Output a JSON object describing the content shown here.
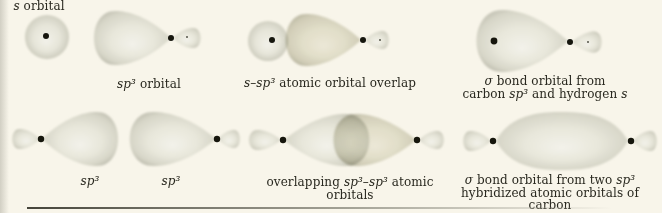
{
  "figure": {
    "name": "hybrid-orbital-bonding-diagrams",
    "panels": [
      {
        "id": "s-orbital",
        "caption": [
          {
            "t": "s",
            "i": true
          },
          {
            "t": " orbital"
          }
        ]
      },
      {
        "id": "sp3-orbital",
        "caption": [
          {
            "t": "sp³",
            "i": true
          },
          {
            "t": " orbital"
          }
        ]
      },
      {
        "id": "s-sp3-overlap",
        "caption": [
          {
            "t": "s",
            "i": true
          },
          {
            "t": "–"
          },
          {
            "t": "sp³",
            "i": true
          },
          {
            "t": " atomic orbital overlap"
          }
        ]
      },
      {
        "id": "sigma-bond-ch",
        "caption_lines": [
          [
            {
              "t": "σ",
              "i": true
            },
            {
              "t": " bond orbital from"
            }
          ],
          [
            {
              "t": "carbon "
            },
            {
              "t": "sp³",
              "i": true
            },
            {
              "t": " and hydrogen "
            },
            {
              "t": "s",
              "i": true
            }
          ]
        ]
      },
      {
        "id": "sp3-pair-left",
        "caption": [
          {
            "t": "sp³",
            "i": true
          }
        ]
      },
      {
        "id": "sp3-pair-right",
        "caption": [
          {
            "t": "sp³",
            "i": true
          }
        ]
      },
      {
        "id": "sp3-sp3-overlap",
        "caption": [
          {
            "t": "overlapping "
          },
          {
            "t": "sp³",
            "i": true
          },
          {
            "t": "–"
          },
          {
            "t": "sp³",
            "i": true
          },
          {
            "t": " atomic orbitals"
          }
        ]
      },
      {
        "id": "sigma-bond-cc",
        "caption_lines": [
          [
            {
              "t": "σ",
              "i": true
            },
            {
              "t": " bond orbital from two "
            },
            {
              "t": "sp³",
              "i": true
            }
          ],
          [
            {
              "t": "hybridized atomic orbitals of carbon"
            }
          ]
        ]
      }
    ],
    "colors": {
      "background": "#f8f5ea",
      "lobe_highlight": "#f3f2ea",
      "lobe_mid": "#e8e7db",
      "lobe_edge": "#b7b6a8",
      "nucleus_dot": "#17160f",
      "text": "#29281f",
      "rule": "#45443a"
    }
  }
}
